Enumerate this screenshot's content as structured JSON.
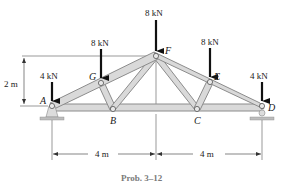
{
  "figure": {
    "caption": "Prob. 3–12",
    "type": "Warren-style roof truss with applied loads"
  },
  "loads": [
    {
      "joint": "A",
      "label": "4 kN"
    },
    {
      "joint": "G",
      "label": "8 kN"
    },
    {
      "joint": "F",
      "label": "8 kN"
    },
    {
      "joint": "E",
      "label": "8 kN"
    },
    {
      "joint": "D",
      "label": "4 kN"
    }
  ],
  "joints": {
    "A": "A",
    "B": "B",
    "C": "C",
    "D": "D",
    "E": "E",
    "F": "F",
    "G": "G"
  },
  "dimensions": {
    "height": "2 m",
    "span_left": "4 m",
    "span_right": "4 m"
  },
  "colors": {
    "member_fill": "#d9d9d9",
    "member_edge": "#8c8c8c",
    "arrow": "#111111",
    "support": "#bdbdbd",
    "caption": "#7a7a7a"
  }
}
